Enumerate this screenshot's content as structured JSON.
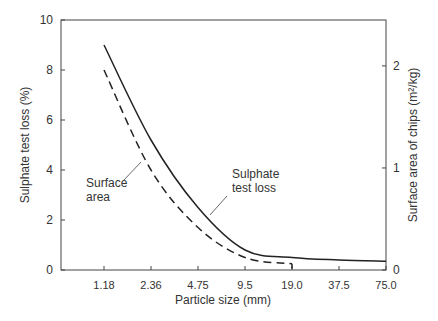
{
  "chart_data": {
    "type": "line",
    "title": "",
    "xlabel": "Particle size (mm)",
    "ylabel": "Sulphate test loss (%)",
    "y2label": "Surface area of chips (m²/kg)",
    "categories": [
      "1.18",
      "2.36",
      "4.75",
      "9.5",
      "19.0",
      "37.5",
      "75.0"
    ],
    "x_scale": "log (sieve sizes, equally spaced)",
    "ylim": [
      0,
      10
    ],
    "yticks": [
      0,
      2,
      4,
      6,
      8,
      10
    ],
    "y2lim": [
      0,
      2.45
    ],
    "y2ticks": [
      0,
      1,
      2
    ],
    "grid": false,
    "series": [
      {
        "name": "Sulphate test loss",
        "style": "solid",
        "axis": "left",
        "values": [
          9.0,
          5.2,
          2.5,
          0.8,
          0.5,
          0.4,
          0.35
        ]
      },
      {
        "name": "Surface area",
        "style": "dashed",
        "axis": "left-scaled",
        "values": [
          8.0,
          4.0,
          1.7,
          0.5,
          0.25,
          null,
          null
        ]
      }
    ],
    "annotations": [
      {
        "text": "Sulphate test loss",
        "lines": [
          "Sulphate",
          "test loss"
        ]
      },
      {
        "text": "Surface area",
        "lines": [
          "Surface",
          "area"
        ]
      }
    ]
  }
}
